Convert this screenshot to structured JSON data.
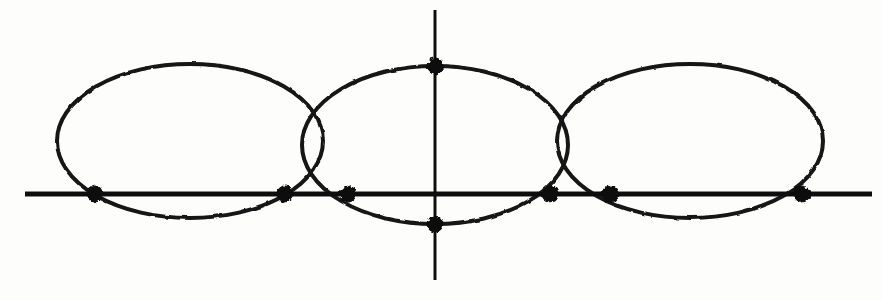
{
  "figure": {
    "title": "Three overlapping ellipses intersected by a horizontal axis",
    "background_color": "#fdfdfc",
    "stroke_color": "#141414",
    "axis_color": "#111111",
    "point_color": "#0d0d0d",
    "width": 882,
    "height": 300
  },
  "chart_data": {
    "type": "scatter",
    "title": "Three overlapping ellipses intersected by a horizontal axis",
    "subtitle": "",
    "xlabel": "",
    "ylabel": "",
    "xlim": [
      0,
      882
    ],
    "ylim": [
      0,
      300
    ],
    "grid": false,
    "legend": "none",
    "axes": [
      {
        "name": "horizontal-axis",
        "orientation": "horizontal",
        "y": 194,
        "x_start": 25,
        "x_end": 872,
        "stroke_width": 5
      },
      {
        "name": "vertical-axis",
        "orientation": "vertical",
        "x": 435,
        "y_start": 10,
        "y_end": 280,
        "stroke_width": 3
      }
    ],
    "ellipses": [
      {
        "name": "left-ellipse",
        "cx": 190,
        "cy": 141,
        "rx": 133,
        "ry": 77,
        "stroke_width": 4
      },
      {
        "name": "middle-ellipse",
        "cx": 435,
        "cy": 145,
        "rx": 133,
        "ry": 79,
        "stroke_width": 4
      },
      {
        "name": "right-ellipse",
        "cx": 690,
        "cy": 141,
        "rx": 133,
        "ry": 77,
        "stroke_width": 4
      }
    ],
    "points": [
      {
        "name": "point-1",
        "x": 95,
        "y": 194,
        "label": ""
      },
      {
        "name": "point-2",
        "x": 285,
        "y": 194,
        "label": ""
      },
      {
        "name": "point-3",
        "x": 348,
        "y": 194,
        "label": ""
      },
      {
        "name": "point-4",
        "x": 435,
        "y": 66,
        "label": ""
      },
      {
        "name": "point-5",
        "x": 435,
        "y": 224,
        "label": ""
      },
      {
        "name": "point-6",
        "x": 550,
        "y": 194,
        "label": ""
      },
      {
        "name": "point-7",
        "x": 610,
        "y": 194,
        "label": ""
      },
      {
        "name": "point-8",
        "x": 802,
        "y": 194,
        "label": ""
      }
    ],
    "point_radius": 8,
    "point_count": 8
  }
}
